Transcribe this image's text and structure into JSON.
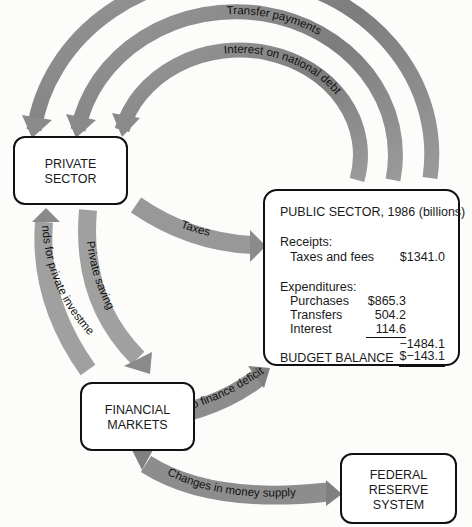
{
  "colors": {
    "arrow": "#8f8f8f",
    "arrow_dark": "#7a7a7a",
    "box_border": "#111111",
    "text": "#1a1a1a"
  },
  "boxes": {
    "private_sector": "PRIVATE\nSECTOR",
    "financial_markets": "FINANCIAL\nMARKETS",
    "federal_reserve": "FEDERAL\nRESERVE\nSYSTEM"
  },
  "public_sector": {
    "title": "PUBLIC SECTOR, 1986 (billions)",
    "receipts_label": "Receipts:",
    "receipts": [
      {
        "label": "Taxes and fees",
        "value": "$1341.0"
      }
    ],
    "expenditures_label": "Expenditures:",
    "expenditures": [
      {
        "label": "Purchases",
        "value": "$865.3"
      },
      {
        "label": "Transfers",
        "value": "504.2"
      },
      {
        "label": "Interest",
        "value": "114.6"
      }
    ],
    "expenditure_total": "−1484.1",
    "balance_label": "BUDGET BALANCE",
    "balance_value": "$−143.1"
  },
  "flows": {
    "purchases": "Purchases",
    "transfer_payments": "Transfer payments",
    "interest": "Interest on national debt",
    "taxes": "Taxes",
    "private_saving": "Private saving",
    "funds_private_investment": "Funds for private investment",
    "funds_deficit": "Funds to finance deficit",
    "money_supply": "Changes in money supply"
  }
}
